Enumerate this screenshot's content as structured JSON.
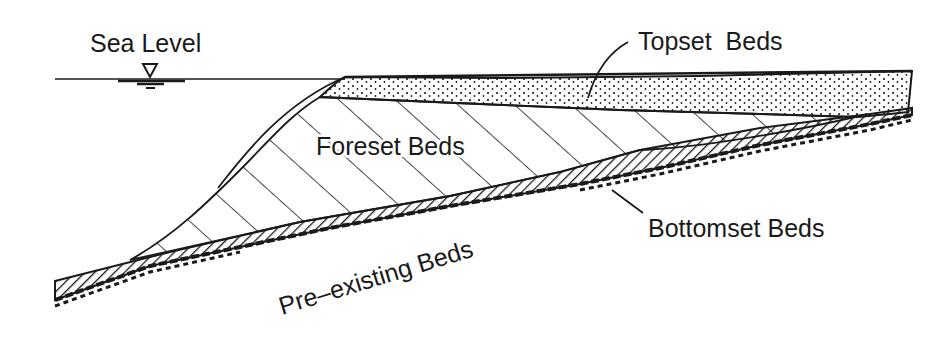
{
  "diagram": {
    "type": "delta cross-section",
    "labels": {
      "sea_level": "Sea Level",
      "topset": "Topset  Beds",
      "foreset": "Foreset Beds",
      "bottomset": "Bottomset Beds",
      "preexisting": "Pre–existing Beds"
    },
    "symbols": {
      "water_level_marker": "inverted-triangle"
    },
    "colors": {
      "ink": "#1a1a1a",
      "background": "#ffffff"
    }
  }
}
